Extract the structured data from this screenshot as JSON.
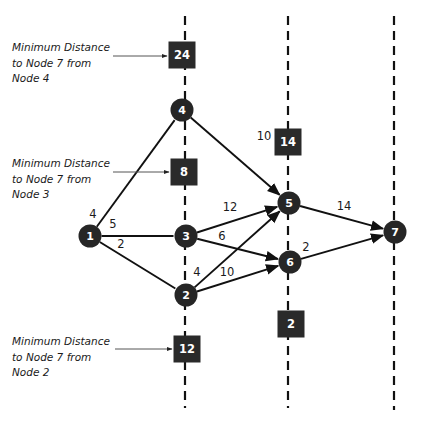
{
  "colors": {
    "background": "#ffffff",
    "node_fill": "#262626",
    "box_fill": "#2a2a2a",
    "edge": "#111111",
    "stage_line": "#111111",
    "pointer": "#555555",
    "text": "#1a1a1a"
  },
  "stage_lines": [
    {
      "id": "stage-1",
      "x": 185,
      "y1": 16,
      "y2": 408
    },
    {
      "id": "stage-2",
      "x": 288,
      "y1": 16,
      "y2": 408
    },
    {
      "id": "stage-3",
      "x": 394,
      "y1": 16,
      "y2": 410
    }
  ],
  "nodes": [
    {
      "id": "1",
      "label": "1",
      "x": 90,
      "y": 236
    },
    {
      "id": "2",
      "label": "2",
      "x": 186,
      "y": 295
    },
    {
      "id": "3",
      "label": "3",
      "x": 186,
      "y": 236
    },
    {
      "id": "4",
      "label": "4",
      "x": 182,
      "y": 110
    },
    {
      "id": "5",
      "label": "5",
      "x": 289,
      "y": 203
    },
    {
      "id": "6",
      "label": "6",
      "x": 290,
      "y": 262
    },
    {
      "id": "7",
      "label": "7",
      "x": 395,
      "y": 232
    }
  ],
  "edges": [
    {
      "from": "1",
      "to": "4",
      "weight": "4",
      "label_x": 93,
      "label_y": 218,
      "arrow": false
    },
    {
      "from": "1",
      "to": "3",
      "weight": "5",
      "label_x": 113,
      "label_y": 228,
      "arrow": false
    },
    {
      "from": "1",
      "to": "2",
      "weight": "2",
      "label_x": 121,
      "label_y": 248,
      "arrow": false
    },
    {
      "from": "4",
      "to": "5",
      "weight": "10",
      "label_x": 264,
      "label_y": 140,
      "arrow": true
    },
    {
      "from": "3",
      "to": "5",
      "weight": "12",
      "label_x": 230,
      "label_y": 211,
      "arrow": true
    },
    {
      "from": "3",
      "to": "6",
      "weight": "6",
      "label_x": 222,
      "label_y": 240,
      "arrow": true
    },
    {
      "from": "2",
      "to": "5",
      "weight": "4",
      "label_x": 197,
      "label_y": 276,
      "arrow": true
    },
    {
      "from": "2",
      "to": "6",
      "weight": "10",
      "label_x": 227,
      "label_y": 276,
      "arrow": true
    },
    {
      "from": "5",
      "to": "7",
      "weight": "14",
      "label_x": 344,
      "label_y": 210,
      "arrow": true
    },
    {
      "from": "6",
      "to": "7",
      "weight": "2",
      "label_x": 306,
      "label_y": 251,
      "arrow": true
    }
  ],
  "distance_boxes": [
    {
      "node": "4",
      "value": "24",
      "x": 182,
      "y": 55,
      "size": 27
    },
    {
      "node": "3",
      "value": "8",
      "x": 184,
      "y": 172,
      "size": 27
    },
    {
      "node": "5",
      "value": "14",
      "x": 288,
      "y": 142,
      "size": 27
    },
    {
      "node": "6",
      "value": "2",
      "x": 291,
      "y": 324,
      "size": 27
    },
    {
      "node": "2",
      "value": "12",
      "x": 187,
      "y": 349,
      "size": 27
    }
  ],
  "annotations": [
    {
      "lines": [
        "Minimum Distance",
        "to Node 7 from",
        "Node 4"
      ],
      "x": 12,
      "y": 51,
      "pointer": {
        "x1": 113,
        "y1": 56,
        "x2": 167,
        "y2": 56
      }
    },
    {
      "lines": [
        "Minimum Distance",
        "to Node 7 from",
        "Node 3"
      ],
      "x": 12,
      "y": 167,
      "pointer": {
        "x1": 113,
        "y1": 172,
        "x2": 169,
        "y2": 172
      }
    },
    {
      "lines": [
        "Minimum Distance",
        "to Node 7 from",
        "Node 2"
      ],
      "x": 12,
      "y": 345,
      "pointer": {
        "x1": 115,
        "y1": 349,
        "x2": 172,
        "y2": 349
      }
    }
  ]
}
